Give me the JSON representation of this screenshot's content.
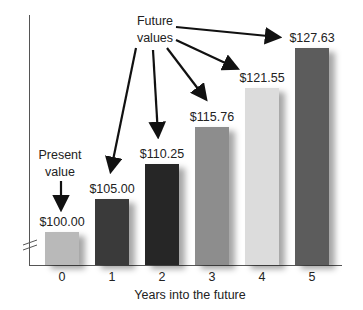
{
  "chart_data": {
    "type": "bar",
    "title": "",
    "xlabel": "Years into the future",
    "ylabel": "",
    "categories": [
      "0",
      "1",
      "2",
      "3",
      "4",
      "5"
    ],
    "values": [
      100.0,
      105.0,
      110.25,
      115.76,
      121.55,
      127.63
    ],
    "value_labels": [
      "$100.00",
      "$105.00",
      "$110.25",
      "$115.76",
      "$121.55",
      "$127.63"
    ],
    "bar_colors": [
      "#b9b9b9",
      "#3a3a3a",
      "#262626",
      "#8d8d8d",
      "#dcdcdc",
      "#5c5c5c"
    ],
    "axis_break": true,
    "grid": false,
    "annotations": [
      {
        "text_lines": [
          "Present",
          "value"
        ],
        "points_to": "0"
      },
      {
        "text_lines": [
          "Future",
          "values"
        ],
        "points_to": [
          "1",
          "2",
          "3",
          "4",
          "5"
        ]
      }
    ]
  },
  "labels": {
    "present_1": "Present",
    "present_2": "value",
    "future_1": "Future",
    "future_2": "values"
  }
}
